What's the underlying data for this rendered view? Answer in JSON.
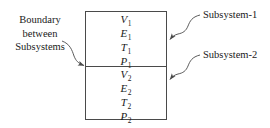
{
  "figure": {
    "background_color": "#ffffff",
    "line_color": "#4a4a4a",
    "text_color": "#1a1a1a"
  },
  "box": {
    "upper_compartment": {
      "name": "Subsystem-1",
      "variables": [
        {
          "symbol": "V",
          "subscript": "1"
        },
        {
          "symbol": "E",
          "subscript": "1"
        },
        {
          "symbol": "T",
          "subscript": "1"
        },
        {
          "symbol": "P",
          "subscript": "1"
        }
      ]
    },
    "lower_compartment": {
      "name": "Subsystem-2",
      "variables": [
        {
          "symbol": "V",
          "subscript": "2"
        },
        {
          "symbol": "E",
          "subscript": "2"
        },
        {
          "symbol": "T",
          "subscript": "2"
        },
        {
          "symbol": "P",
          "subscript": "2"
        }
      ]
    }
  },
  "annotations": {
    "boundary": {
      "line1": "Boundary",
      "line2": "between",
      "line3": "Subsystems"
    },
    "subsystem1": "Subsystem-1",
    "subsystem2": "Subsystem-2"
  }
}
